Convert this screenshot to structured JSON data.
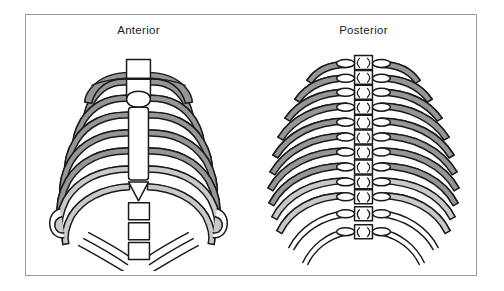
{
  "figure": {
    "border_color": "#9b9b9b",
    "background_color": "#ffffff"
  },
  "panels": [
    {
      "id": "anterior",
      "label": "Anterior",
      "structures": [
        "manubrium",
        "clavicle-left",
        "clavicle-right",
        "sternum-body",
        "xiphoid-process",
        "lumbar-vertebrae",
        "true-ribs",
        "false-ribs",
        "costal-arch"
      ],
      "rib_pairs": 12
    },
    {
      "id": "posterior",
      "label": "Posterior",
      "structures": [
        "vertebral-column",
        "transverse-processes",
        "costovertebral-facets",
        "true-ribs",
        "false-ribs",
        "floating-ribs"
      ],
      "rib_pairs": 12,
      "vertebrae_count": 12
    }
  ],
  "colors": {
    "outline": "#1a1a1a",
    "rib_shade_dark": "#969696",
    "rib_shade_light": "#c9c9c9",
    "bone_white": "#ffffff",
    "label_text": "#1b1b1b"
  }
}
